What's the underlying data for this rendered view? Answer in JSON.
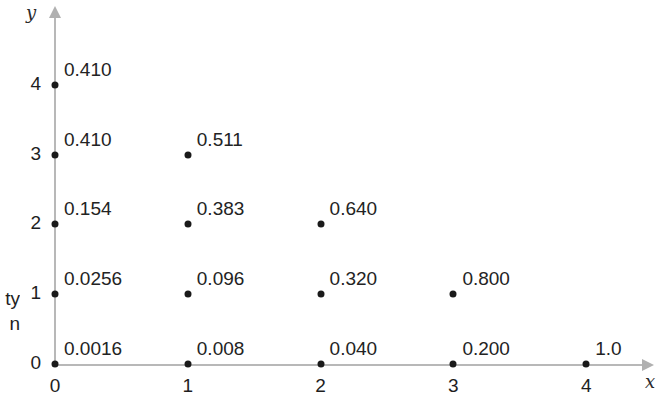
{
  "chart_data": {
    "type": "scatter",
    "title": "",
    "xlabel": "x",
    "ylabel": "y",
    "xlim": [
      0,
      4
    ],
    "ylim": [
      0,
      4
    ],
    "grid": false,
    "legend": null,
    "xticks": [
      "0",
      "1",
      "2",
      "3",
      "4"
    ],
    "yticks": [
      "0",
      "1",
      "2",
      "3",
      "4"
    ],
    "xtick_values": [
      0,
      1,
      2,
      3,
      4
    ],
    "ytick_values": [
      0,
      1,
      2,
      3,
      4
    ],
    "points": [
      {
        "x": 0,
        "y": 4,
        "label": "0.410"
      },
      {
        "x": 0,
        "y": 3,
        "label": "0.410"
      },
      {
        "x": 0,
        "y": 2,
        "label": "0.154"
      },
      {
        "x": 0,
        "y": 1,
        "label": "0.0256"
      },
      {
        "x": 0,
        "y": 0,
        "label": "0.0016"
      },
      {
        "x": 1,
        "y": 3,
        "label": "0.511"
      },
      {
        "x": 1,
        "y": 2,
        "label": "0.383"
      },
      {
        "x": 1,
        "y": 1,
        "label": "0.096"
      },
      {
        "x": 1,
        "y": 0,
        "label": "0.008"
      },
      {
        "x": 2,
        "y": 2,
        "label": "0.640"
      },
      {
        "x": 2,
        "y": 1,
        "label": "0.320"
      },
      {
        "x": 2,
        "y": 0,
        "label": "0.040"
      },
      {
        "x": 3,
        "y": 1,
        "label": "0.800"
      },
      {
        "x": 3,
        "y": 0,
        "label": "0.200"
      },
      {
        "x": 4,
        "y": 0,
        "label": "1.0"
      }
    ]
  },
  "edge_caption": {
    "line1": "ty",
    "line2": "n"
  }
}
